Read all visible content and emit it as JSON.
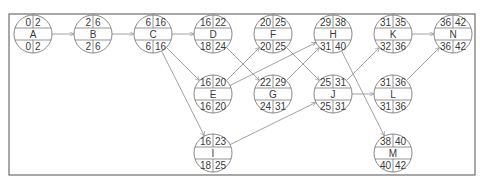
{
  "diagram": {
    "type": "activity-on-node network (critical path)",
    "node_fields": [
      "ES",
      "EF",
      "name",
      "LS",
      "LF"
    ],
    "nodes": [
      {
        "id": "A",
        "es": "0",
        "ef": "2",
        "ls": "0",
        "lf": "2",
        "x": 33,
        "y": 34
      },
      {
        "id": "B",
        "es": "2",
        "ef": "6",
        "ls": "2",
        "lf": "6",
        "x": 93,
        "y": 34
      },
      {
        "id": "C",
        "es": "6",
        "ef": "16",
        "ls": "6",
        "lf": "16",
        "x": 153,
        "y": 34
      },
      {
        "id": "D",
        "es": "16",
        "ef": "22",
        "ls": "18",
        "lf": "24",
        "x": 213,
        "y": 34
      },
      {
        "id": "F",
        "es": "20",
        "ef": "25",
        "ls": "20",
        "lf": "25",
        "x": 273,
        "y": 34
      },
      {
        "id": "H",
        "es": "29",
        "ef": "38",
        "ls": "31",
        "lf": "40",
        "x": 333,
        "y": 34
      },
      {
        "id": "K",
        "es": "31",
        "ef": "35",
        "ls": "32",
        "lf": "36",
        "x": 393,
        "y": 34
      },
      {
        "id": "N",
        "es": "36",
        "ef": "42",
        "ls": "36",
        "lf": "42",
        "x": 453,
        "y": 34
      },
      {
        "id": "E",
        "es": "16",
        "ef": "20",
        "ls": "16",
        "lf": "20",
        "x": 213,
        "y": 94
      },
      {
        "id": "G",
        "es": "22",
        "ef": "29",
        "ls": "24",
        "lf": "31",
        "x": 273,
        "y": 94
      },
      {
        "id": "J",
        "es": "25",
        "ef": "31",
        "ls": "25",
        "lf": "31",
        "x": 333,
        "y": 94
      },
      {
        "id": "L",
        "es": "31",
        "ef": "36",
        "ls": "31",
        "lf": "36",
        "x": 393,
        "y": 94
      },
      {
        "id": "I",
        "es": "16",
        "ef": "23",
        "ls": "18",
        "lf": "25",
        "x": 213,
        "y": 153
      },
      {
        "id": "M",
        "es": "38",
        "ef": "40",
        "ls": "40",
        "lf": "42",
        "x": 393,
        "y": 153
      }
    ],
    "edges": [
      [
        "A",
        "B"
      ],
      [
        "B",
        "C"
      ],
      [
        "C",
        "D"
      ],
      [
        "C",
        "E"
      ],
      [
        "C",
        "I"
      ],
      [
        "D",
        "G"
      ],
      [
        "E",
        "F"
      ],
      [
        "E",
        "H"
      ],
      [
        "F",
        "J"
      ],
      [
        "G",
        "H"
      ],
      [
        "I",
        "J"
      ],
      [
        "H",
        "M"
      ],
      [
        "J",
        "K"
      ],
      [
        "J",
        "L"
      ],
      [
        "K",
        "N"
      ],
      [
        "L",
        "N"
      ]
    ],
    "colors": {
      "line": "#8a8a8a",
      "frame": "#6e6e6e",
      "text": "#3a3a3a"
    }
  }
}
